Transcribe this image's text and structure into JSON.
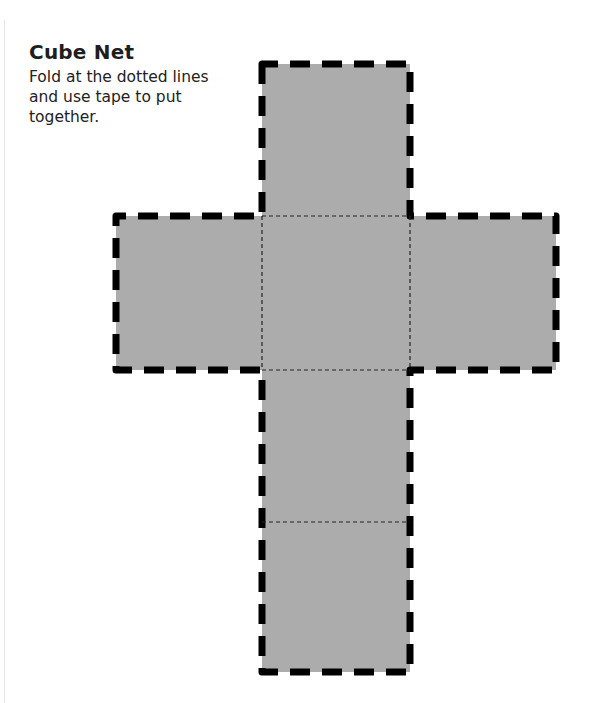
{
  "document": {
    "title": "Cube Net",
    "instructions": "Fold at the dotted lines and use tape to put together."
  },
  "net": {
    "face_color": "#acacac",
    "cut_line_color": "#000000",
    "fold_line_color": "#222222",
    "faces": [
      {
        "id": "top",
        "x": 262,
        "y": 64,
        "w": 148,
        "h": 152
      },
      {
        "id": "left",
        "x": 116,
        "y": 216,
        "w": 146,
        "h": 154
      },
      {
        "id": "center",
        "x": 262,
        "y": 216,
        "w": 148,
        "h": 154
      },
      {
        "id": "right",
        "x": 410,
        "y": 216,
        "w": 146,
        "h": 154
      },
      {
        "id": "lower",
        "x": 262,
        "y": 370,
        "w": 148,
        "h": 152
      },
      {
        "id": "bottom",
        "x": 262,
        "y": 522,
        "w": 148,
        "h": 150
      }
    ]
  }
}
